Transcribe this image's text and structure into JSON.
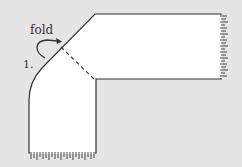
{
  "diagram": {
    "type": "scarf folding instruction",
    "background_color": "#e5e5e5",
    "shape_fill": "#ffffff",
    "stroke_color": "#333333",
    "labels": {
      "fold": "fold",
      "step": "1."
    },
    "elements": [
      {
        "name": "scarf-shape",
        "description": "L-shaped folded scarf with fringed ends"
      },
      {
        "name": "fold-line",
        "style": "dashed",
        "description": "diagonal fold crease"
      },
      {
        "name": "fold-arrow",
        "description": "curved arrow indicating fold direction"
      },
      {
        "name": "fringe-right",
        "description": "fringe on right end of scarf"
      },
      {
        "name": "fringe-bottom",
        "description": "fringe on bottom end of scarf"
      }
    ]
  }
}
